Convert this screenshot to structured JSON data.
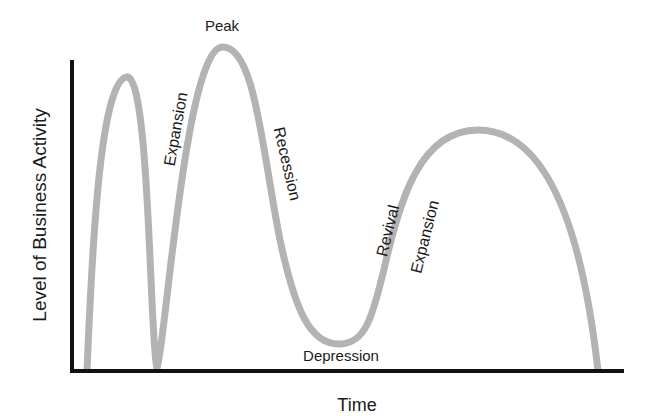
{
  "diagram": {
    "y_axis_label": "Level of Business Activity",
    "x_axis_label": "Time",
    "phase_labels": {
      "peak": "Peak",
      "expansion_1": "Expansion",
      "recession": "Recession",
      "depression": "Depression",
      "revival": "Revival",
      "expansion_2": "Expansion"
    },
    "colors": {
      "curve": "#b3b3b3",
      "axis": "#111111",
      "text": "#1a1a1a"
    }
  }
}
